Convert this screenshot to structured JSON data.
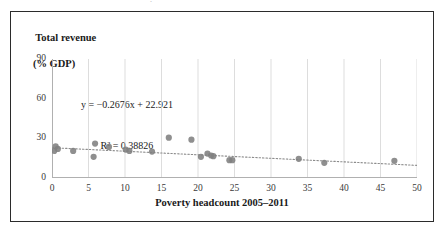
{
  "page": {
    "artifact_glyph": "·"
  },
  "chart_data": {
    "type": "scatter",
    "title": "",
    "xlabel": "Poverty headcount 2005–2011",
    "ylabel_line1": "Total revenue",
    "ylabel_line2": "(% GDP)",
    "xlim": [
      0,
      50
    ],
    "ylim": [
      0,
      90
    ],
    "xticks": [
      0,
      5,
      10,
      15,
      20,
      25,
      30,
      35,
      40,
      45,
      50
    ],
    "yticks": [
      0,
      30,
      60,
      90
    ],
    "grid": "vertical",
    "legend": "none",
    "marker_color": "#808080",
    "trendline_color": "#8c8c8c",
    "trendline_style": "dotted",
    "annotations": {
      "equation": "y = −0.2676x + 22.921",
      "r_squared": "R² = 0.38826"
    },
    "fit": {
      "slope": -0.2676,
      "intercept": 22.921,
      "r2": 0.38826
    },
    "points": [
      {
        "x": 0.3,
        "y": 20.5
      },
      {
        "x": 0.5,
        "y": 24.0
      },
      {
        "x": 0.8,
        "y": 22.0
      },
      {
        "x": 2.9,
        "y": 20.5
      },
      {
        "x": 5.7,
        "y": 16.0
      },
      {
        "x": 5.9,
        "y": 26.0
      },
      {
        "x": 7.8,
        "y": 23.5
      },
      {
        "x": 10.1,
        "y": 21.5
      },
      {
        "x": 10.6,
        "y": 20.5
      },
      {
        "x": 13.7,
        "y": 20.0
      },
      {
        "x": 16.0,
        "y": 30.5
      },
      {
        "x": 19.1,
        "y": 29.0
      },
      {
        "x": 20.4,
        "y": 16.0
      },
      {
        "x": 21.3,
        "y": 18.5
      },
      {
        "x": 21.8,
        "y": 17.0
      },
      {
        "x": 22.1,
        "y": 16.5
      },
      {
        "x": 24.3,
        "y": 13.5
      },
      {
        "x": 24.7,
        "y": 13.5
      },
      {
        "x": 33.8,
        "y": 14.5
      },
      {
        "x": 37.3,
        "y": 11.5
      },
      {
        "x": 46.9,
        "y": 13.0
      }
    ]
  }
}
